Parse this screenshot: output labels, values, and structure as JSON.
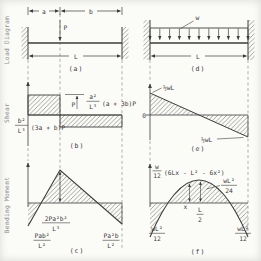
{
  "side": {
    "load": "Load Diagram",
    "shear": "Shear",
    "moment": "Bending Moment"
  },
  "captions": {
    "a": "(a)",
    "b": "(b)",
    "c": "(c)",
    "d": "(d)",
    "e": "(e)",
    "f": "(f)"
  },
  "left": {
    "load": {
      "a": "a",
      "b": "b",
      "p": "P",
      "l": "L"
    },
    "shear": {
      "jump": "P",
      "left_num": "b²",
      "left_den": "L³",
      "left_factor": "(3a + b)P",
      "right_num": "a²",
      "right_den": "L³",
      "right_factor": "(a + 3b)P"
    },
    "moment": {
      "peak_num": "2Pa²b²",
      "peak_den": "L³",
      "left_num": "Pab²",
      "left_den": "L²",
      "right_num": "Pa²b",
      "right_den": "L²"
    }
  },
  "right": {
    "load": {
      "w": "w",
      "l": "L"
    },
    "shear": {
      "zero": "0",
      "top": "½wL",
      "bottom": "½wL"
    },
    "moment": {
      "eq_num": "w",
      "eq_den": "12",
      "eq_rest": "(6Lx - L² - 6x²)",
      "peak_num": "wL²",
      "peak_den": "24",
      "x": "x",
      "half_num": "L",
      "half_den": "2",
      "left_num": "wL²",
      "left_den": "12",
      "right_num": "wL²",
      "right_den": "12"
    }
  },
  "colors": {
    "ink": "#3c3c3c",
    "hatch": "#5a5a5a",
    "paper": "#fbfbf8",
    "muted": "#8a8a8a"
  }
}
